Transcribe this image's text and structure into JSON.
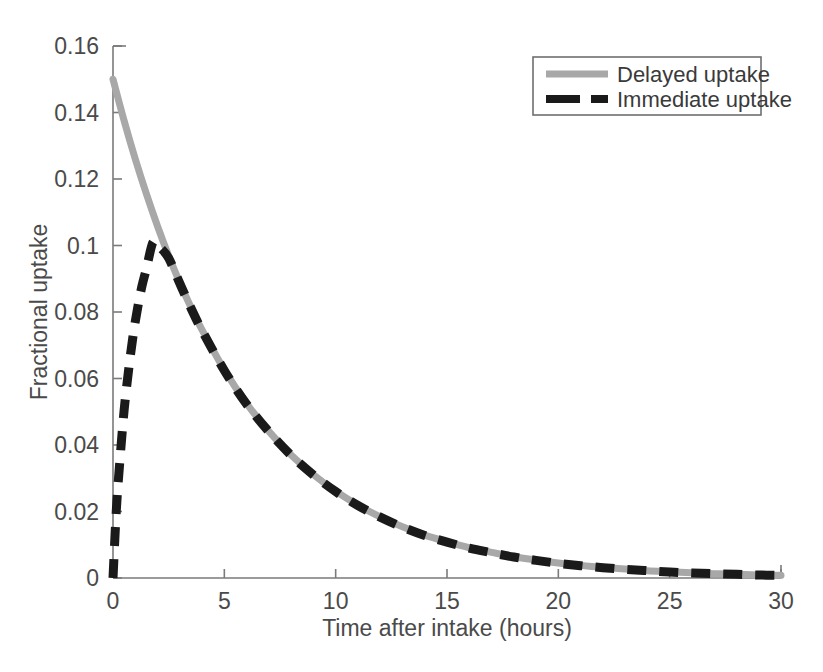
{
  "chart_data": {
    "type": "line",
    "title": "",
    "xlabel": "Time after intake (hours)",
    "ylabel": "Fractional uptake",
    "xlim": [
      0,
      30
    ],
    "ylim": [
      0,
      0.16
    ],
    "xticks": [
      "0",
      "5",
      "10",
      "15",
      "20",
      "25",
      "30"
    ],
    "xtick_values": [
      0,
      5,
      10,
      15,
      20,
      25,
      30
    ],
    "yticks": [
      "0",
      "0.02",
      "0.04",
      "0.06",
      "0.08",
      "0.1",
      "0.12",
      "0.14",
      "0.16"
    ],
    "ytick_values": [
      0,
      0.02,
      0.04,
      0.06,
      0.08,
      0.1,
      0.12,
      0.14,
      0.16
    ],
    "grid": false,
    "legend_position": "top-right",
    "series": [
      {
        "name": "Delayed uptake",
        "style": "solid",
        "color": "#a8a8a8",
        "x": [
          0,
          0.5,
          1,
          1.5,
          2,
          2.5,
          3,
          3.5,
          4,
          5,
          6,
          7,
          8,
          9,
          10,
          11,
          12,
          13,
          14,
          15,
          16,
          17,
          18,
          19,
          20,
          21,
          22,
          23,
          24,
          25,
          26,
          27,
          28,
          29,
          30
        ],
        "values": [
          0.15,
          0.1375,
          0.126,
          0.1155,
          0.1058,
          0.0969,
          0.0888,
          0.0814,
          0.0746,
          0.0626,
          0.0525,
          0.0441,
          0.037,
          0.0311,
          0.0261,
          0.0219,
          0.0184,
          0.0154,
          0.0129,
          0.0109,
          0.0091,
          0.0077,
          0.0064,
          0.0054,
          0.0045,
          0.0038,
          0.0032,
          0.0027,
          0.0022,
          0.0019,
          0.0016,
          0.0013,
          0.0011,
          0.0009,
          0.0008
        ]
      },
      {
        "name": "Immediate uptake",
        "style": "dashed",
        "color": "#1a1a1a",
        "x": [
          0,
          0.15,
          0.3,
          0.5,
          0.7,
          0.9,
          1.1,
          1.3,
          1.5,
          1.8,
          2.1,
          2.5,
          3,
          3.5,
          4,
          5,
          6,
          7,
          8,
          9,
          10,
          11,
          12,
          13,
          14,
          15,
          16,
          17,
          18,
          19,
          20,
          21,
          22,
          23,
          24,
          25,
          26,
          27,
          28,
          29,
          30
        ],
        "values": [
          0.0,
          0.0205,
          0.0345,
          0.0505,
          0.0625,
          0.0728,
          0.081,
          0.0878,
          0.093,
          0.101,
          0.0995,
          0.0962,
          0.0886,
          0.0812,
          0.0744,
          0.0624,
          0.0523,
          0.044,
          0.0369,
          0.031,
          0.026,
          0.0218,
          0.0183,
          0.0153,
          0.0128,
          0.0108,
          0.009,
          0.0076,
          0.0063,
          0.0053,
          0.0044,
          0.0037,
          0.0031,
          0.0026,
          0.0022,
          0.0018,
          0.0015,
          0.0013,
          0.0011,
          0.0009,
          0.0008
        ]
      }
    ]
  },
  "legend": {
    "entries": [
      {
        "label": "Delayed uptake",
        "color": "#a8a8a8",
        "style": "solid"
      },
      {
        "label": "Immediate uptake",
        "color": "#1a1a1a",
        "style": "dashed"
      }
    ]
  }
}
